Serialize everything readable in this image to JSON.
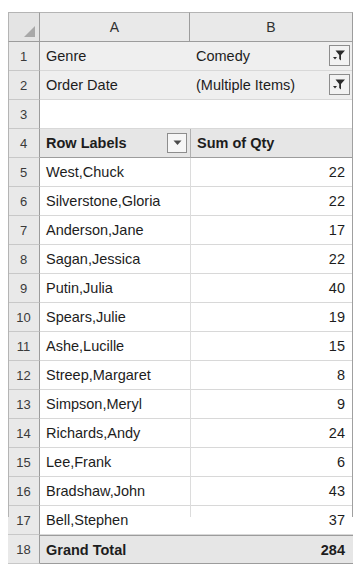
{
  "grid": {
    "column_headers": [
      "A",
      "B"
    ],
    "select_all_icon": "select-all-triangle-icon",
    "filter_icon": "filter-funnel-icon",
    "dropdown_icon": "chevron-down-icon"
  },
  "rows": [
    {
      "number": "1",
      "kind": "filter",
      "label": "Genre",
      "value": "Comedy",
      "has_filter_button": true
    },
    {
      "number": "2",
      "kind": "filter",
      "label": "Order Date",
      "value": "(Multiple Items)",
      "has_filter_button": true
    },
    {
      "number": "3",
      "kind": "blank",
      "label": "",
      "value": ""
    },
    {
      "number": "4",
      "kind": "header",
      "label": "Row Labels",
      "value": "Sum of Qty",
      "has_dropdown_button": true
    },
    {
      "number": "5",
      "kind": "data",
      "label": "West,Chuck",
      "value": "22"
    },
    {
      "number": "6",
      "kind": "data",
      "label": "Silverstone,Gloria",
      "value": "22"
    },
    {
      "number": "7",
      "kind": "data",
      "label": "Anderson,Jane",
      "value": "17"
    },
    {
      "number": "8",
      "kind": "data",
      "label": "Sagan,Jessica",
      "value": "22"
    },
    {
      "number": "9",
      "kind": "data",
      "label": "Putin,Julia",
      "value": "40"
    },
    {
      "number": "10",
      "kind": "data",
      "label": "Spears,Julie",
      "value": "19"
    },
    {
      "number": "11",
      "kind": "data",
      "label": "Ashe,Lucille",
      "value": "15"
    },
    {
      "number": "12",
      "kind": "data",
      "label": "Streep,Margaret",
      "value": "8"
    },
    {
      "number": "13",
      "kind": "data",
      "label": "Simpson,Meryl",
      "value": "9"
    },
    {
      "number": "14",
      "kind": "data",
      "label": "Richards,Andy",
      "value": "24"
    },
    {
      "number": "15",
      "kind": "data",
      "label": "Lee,Frank",
      "value": "6"
    },
    {
      "number": "16",
      "kind": "data",
      "label": "Bradshaw,John",
      "value": "43"
    },
    {
      "number": "17",
      "kind": "data",
      "label": "Bell,Stephen",
      "value": "37"
    },
    {
      "number": "18",
      "kind": "total",
      "label": "Grand Total",
      "value": "284"
    }
  ],
  "colors": {
    "header_fill": "#e9e9e9",
    "filter_row_fill": "#efefef",
    "total_fill": "#e6e6e6",
    "gridline": "#d8d8d8",
    "text": "#1d1d1d"
  }
}
